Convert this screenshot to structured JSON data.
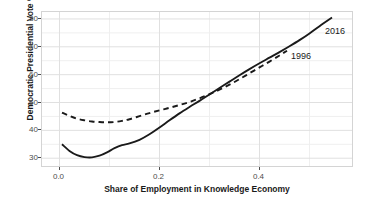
{
  "chart_data": {
    "type": "line",
    "title": "",
    "subtitle": "",
    "xlabel": "Share of Employment in Knowledge Economy",
    "ylabel": "Democratic Presidential Vote %",
    "xlim": [
      -0.035,
      0.585
    ],
    "ylim": [
      27.2,
      82.5
    ],
    "xticks": [
      0.0,
      0.2,
      0.4
    ],
    "xtick_labels": [
      "0.0",
      "0.2",
      "0.4"
    ],
    "yticks": [
      30,
      40,
      50,
      60,
      70,
      80
    ],
    "ytick_labels": [
      "30",
      "40",
      "50",
      "60",
      "70",
      "80"
    ],
    "grid": true,
    "grid_minor": true,
    "legend_position": "inline-annotation",
    "series": [
      {
        "name": "2016",
        "label": "2016",
        "style": "solid",
        "color": "#1a1a1a",
        "x": [
          0.005,
          0.02,
          0.035,
          0.05,
          0.065,
          0.08,
          0.095,
          0.11,
          0.125,
          0.14,
          0.16,
          0.18,
          0.2,
          0.22,
          0.24,
          0.26,
          0.28,
          0.3,
          0.32,
          0.34,
          0.36,
          0.38,
          0.4,
          0.42,
          0.44,
          0.46,
          0.48,
          0.5,
          0.52,
          0.545
        ],
        "values": [
          35.0,
          32.6,
          31.1,
          30.4,
          30.3,
          30.9,
          32.1,
          33.6,
          34.7,
          35.3,
          36.6,
          38.6,
          41.0,
          43.6,
          46.1,
          48.4,
          50.6,
          52.9,
          55.2,
          57.5,
          59.8,
          62.0,
          64.1,
          66.1,
          68.1,
          70.2,
          72.4,
          74.8,
          77.4,
          80.5
        ]
      },
      {
        "name": "1996",
        "label": "1996",
        "style": "dashed",
        "color": "#1a1a1a",
        "x": [
          0.005,
          0.02,
          0.035,
          0.05,
          0.065,
          0.08,
          0.095,
          0.11,
          0.125,
          0.14,
          0.16,
          0.18,
          0.2,
          0.22,
          0.24,
          0.26,
          0.28,
          0.3,
          0.32,
          0.34,
          0.36,
          0.38,
          0.4,
          0.42,
          0.44,
          0.455
        ],
        "values": [
          46.4,
          45.2,
          44.2,
          43.6,
          43.2,
          43.0,
          42.9,
          43.0,
          43.4,
          44.0,
          45.1,
          46.2,
          47.2,
          48.1,
          49.1,
          50.2,
          51.5,
          53.0,
          54.6,
          56.4,
          58.4,
          60.5,
          62.6,
          64.7,
          66.9,
          68.6
        ]
      }
    ],
    "annotations": [
      {
        "text": "2016",
        "x": 0.555,
        "y": 77.0
      },
      {
        "text": "1996",
        "x": 0.475,
        "y": 68.0
      }
    ]
  },
  "colors": {
    "line": "#1a1a1a",
    "panel_border": "#d4d4d4",
    "grid_major": "#e0e0e0",
    "grid_minor": "#efefef",
    "tick_text": "#4d4d4d",
    "axis_title": "#1a1a1a",
    "background": "#ffffff"
  }
}
